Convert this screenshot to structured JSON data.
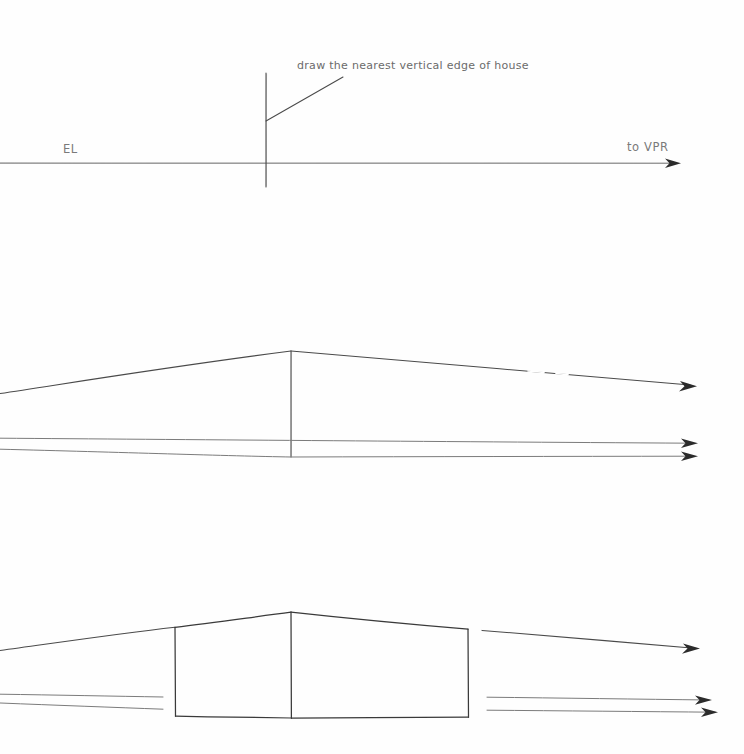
{
  "document": {
    "title": "Two-point perspective house construction",
    "background_color": "#fefefe",
    "ink_color": "#4a4a4a",
    "label_color": "#6b6b6b",
    "width": 744,
    "height": 754
  },
  "panels": [
    {
      "id": "panel-top",
      "name": "eye-level-and-nearest-edge",
      "annotation": "draw the nearest vertical edge of house",
      "labels": {
        "eye_level": "EL",
        "vanishing_point_right": "to VPR"
      },
      "geometry": {
        "eye_level_line": {
          "x1": 0,
          "y1": 163,
          "x2": 676,
          "y2": 163
        },
        "vertical_edge": {
          "x": 266,
          "y_top": 73,
          "y_bottom": 187
        },
        "leader_line": {
          "x1": 266,
          "y1": 121,
          "x2": 343,
          "y2": 77
        },
        "arrow_tip": {
          "x": 680,
          "y": 163
        }
      }
    },
    {
      "id": "panel-middle",
      "name": "convergence-lines-to-vanishing-points",
      "annotation": "",
      "labels": {},
      "geometry": {
        "vertical_edge": {
          "x": 291,
          "y_top": 351,
          "y_bottom": 457
        },
        "ridge_left": {
          "x1": 0,
          "y1": 393,
          "x2": 291,
          "y2": 351
        },
        "ridge_right": {
          "x1": 291,
          "y1": 351,
          "x2": 694,
          "y2": 385
        },
        "base_upper": {
          "x1": 0,
          "y1": 438,
          "x2": 694,
          "y2": 443
        },
        "base_lower": {
          "x1": 0,
          "y1": 449,
          "x2": 694,
          "y2": 456
        }
      }
    },
    {
      "id": "panel-bottom",
      "name": "completed-house-box",
      "annotation": "",
      "labels": {},
      "geometry": {
        "house": {
          "left_edge_x": 175,
          "right_edge_x": 468,
          "near_edge_x": 291,
          "peak_y": 612,
          "left_top_y": 627,
          "right_top_y": 629,
          "left_bottom_y": 716,
          "right_bottom_y": 717,
          "near_bottom_y": 718
        },
        "guide_roof_left": {
          "x1": 0,
          "y1": 650,
          "x2": 175,
          "y2": 627
        },
        "guide_roof_right": {
          "x1": 482,
          "y1": 630,
          "x2": 697,
          "y2": 648
        },
        "guide_base_left_upper": {
          "x1": 0,
          "y1": 694,
          "x2": 163,
          "y2": 697
        },
        "guide_base_left_lower": {
          "x1": 0,
          "y1": 703,
          "x2": 163,
          "y2": 709
        },
        "guide_base_right_upper": {
          "x1": 487,
          "y1": 697,
          "x2": 709,
          "y2": 700
        },
        "guide_base_right_lower": {
          "x1": 487,
          "y1": 710,
          "x2": 715,
          "y2": 712
        }
      }
    }
  ],
  "annotations": {
    "nearest_edge_note": "draw the nearest vertical edge of house",
    "eye_level_abbrev": "EL",
    "vpr_note": "to VPR"
  }
}
